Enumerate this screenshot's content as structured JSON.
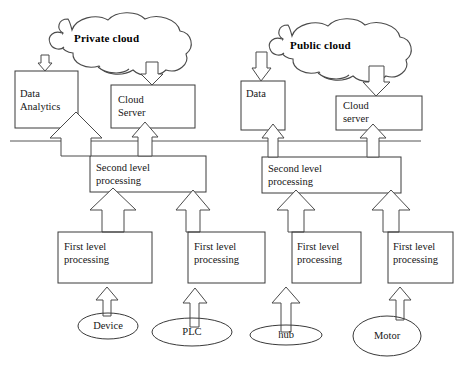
{
  "diagram": {
    "colors": {
      "stroke": "#3a3a3a",
      "arrow_stroke": "#4a4a4a",
      "background": "#ffffff",
      "text": "#161616"
    },
    "clouds": [
      {
        "id": "private-cloud",
        "label": "Private cloud"
      },
      {
        "id": "public-cloud",
        "label": "Public cloud"
      }
    ],
    "cloud_boxes": [
      {
        "id": "data-analytics",
        "label": "Data\nAnalytics"
      },
      {
        "id": "cloud-server-private",
        "label": "Cloud\nServer"
      },
      {
        "id": "data",
        "label": "Data"
      },
      {
        "id": "cloud-server-public",
        "label": "Cloud\nserver"
      }
    ],
    "second_level_boxes": [
      {
        "id": "second-level-left",
        "label": "Second level\nprocessing"
      },
      {
        "id": "second-level-right",
        "label": "Second level\nprocessing"
      }
    ],
    "first_level_boxes": [
      {
        "id": "first-level-1",
        "label": "First level\nprocessing"
      },
      {
        "id": "first-level-2",
        "label": "First level\nprocessing"
      },
      {
        "id": "first-level-3",
        "label": "First level\nprocessing"
      },
      {
        "id": "first-level-4",
        "label": "First level\nprocessing"
      }
    ],
    "devices": [
      {
        "id": "device",
        "label": "Device"
      },
      {
        "id": "plc",
        "label": "PLC"
      },
      {
        "id": "hub",
        "label": "hub"
      },
      {
        "id": "motor",
        "label": "Motor"
      }
    ]
  }
}
